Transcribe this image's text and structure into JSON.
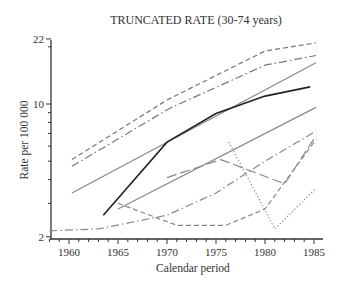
{
  "chart_data": {
    "type": "line",
    "title": "TRUNCATED RATE (30-74 years)",
    "xlabel": "Calendar period",
    "ylabel": "Rate per 100 000",
    "yscale": "log",
    "ylim": [
      2,
      22
    ],
    "xlim": [
      1958,
      1986
    ],
    "xticks": [
      1960,
      1965,
      1970,
      1975,
      1980,
      1985
    ],
    "yticks": [
      2,
      10,
      22
    ],
    "grid": false,
    "legend": null,
    "series": [
      {
        "name": "series-1 (dashed, top)",
        "style": "dashed",
        "color": "#777777",
        "x": [
          1960.3,
          1970,
          1980,
          1985.2
        ],
        "values": [
          5.1,
          10.5,
          19.0,
          21.0
        ]
      },
      {
        "name": "series-2 (dash-dot, upper)",
        "style": "dashdot",
        "color": "#777777",
        "x": [
          1960.3,
          1970.3,
          1980,
          1985.2
        ],
        "values": [
          4.7,
          9.5,
          16.0,
          18.0
        ]
      },
      {
        "name": "series-3 (solid gray, upper)",
        "style": "solid",
        "color": "#888888",
        "x": [
          1960.3,
          1985.2
        ],
        "values": [
          3.4,
          16.5
        ]
      },
      {
        "name": "series-4 (solid black)",
        "style": "solid",
        "color": "#222222",
        "x": [
          1963.5,
          1970,
          1975,
          1980,
          1984.6
        ],
        "values": [
          2.6,
          6.3,
          8.9,
          11.0,
          12.3
        ]
      },
      {
        "name": "series-5 (solid gray, lower)",
        "style": "solid",
        "color": "#888888",
        "x": [
          1965,
          1985.2
        ],
        "values": [
          2.8,
          9.6
        ]
      },
      {
        "name": "series-6 (long-dash, mid)",
        "style": "longdash",
        "color": "#888888",
        "x": [
          1970,
          1975.5,
          1982,
          1985.2
        ],
        "values": [
          4.1,
          5.1,
          3.8,
          6.8
        ]
      },
      {
        "name": "series-7 (dash-dot, lower)",
        "style": "dashdot",
        "color": "#888888",
        "x": [
          1958,
          1963,
          1970,
          1975,
          1980,
          1985.2
        ],
        "values": [
          2.15,
          2.2,
          2.6,
          3.4,
          5.0,
          7.2
        ]
      },
      {
        "name": "series-8 (dashed, dip)",
        "style": "dashed",
        "color": "#888888",
        "x": [
          1965,
          1971,
          1976,
          1980,
          1985.2
        ],
        "values": [
          3.0,
          2.3,
          2.3,
          2.8,
          6.5
        ]
      },
      {
        "name": "series-9 (dotted)",
        "style": "dotted",
        "color": "#888888",
        "x": [
          1976.3,
          1981,
          1985.2
        ],
        "values": [
          6.3,
          2.2,
          3.6
        ]
      }
    ]
  }
}
